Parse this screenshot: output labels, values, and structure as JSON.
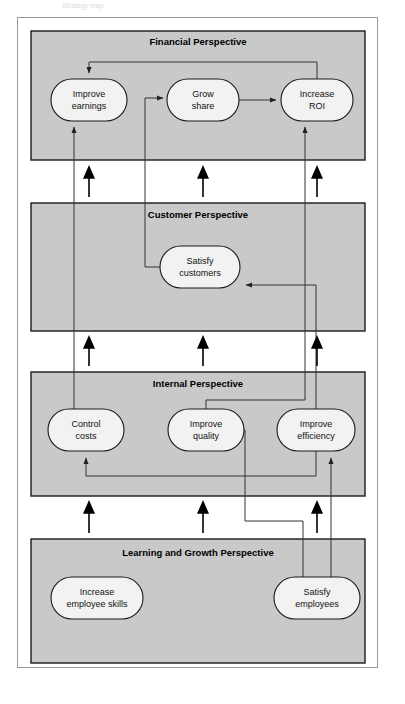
{
  "document": {
    "title_fragment": "Strategy map",
    "frame": {
      "x": 17,
      "y": 17,
      "width": 361,
      "height": 651
    }
  },
  "theme": {
    "panel_fill": "#c9c9c9",
    "panel_stroke": "#1a1a1a",
    "node_fill": "#f2f2f2",
    "node_stroke": "#1a1a1a",
    "connector_stroke": "#333333",
    "arrow_fill": "#000000",
    "page_background": "#ffffff",
    "frame_stroke": "#9a9a9a"
  },
  "panels": [
    {
      "id": "financial",
      "title": "Financial Perspective",
      "x": 31,
      "y": 31,
      "width": 334,
      "height": 129,
      "title_x": 198,
      "title_y": 45
    },
    {
      "id": "customer",
      "title": "Customer Perspective",
      "x": 31,
      "y": 203,
      "width": 334,
      "height": 128,
      "title_x": 198,
      "title_y": 218
    },
    {
      "id": "internal",
      "title": "Internal Perspective",
      "x": 31,
      "y": 372,
      "width": 334,
      "height": 124,
      "title_x": 198,
      "title_y": 387
    },
    {
      "id": "learning",
      "title": "Learning and Growth Perspective",
      "x": 31,
      "y": 539,
      "width": 334,
      "height": 124,
      "title_x": 198,
      "title_y": 556
    }
  ],
  "nodes": [
    {
      "id": "improve-earnings",
      "lines": [
        "Improve",
        "earnings"
      ],
      "cx": 89,
      "cy": 100,
      "rx": 38,
      "ry": 21,
      "panel": "financial"
    },
    {
      "id": "grow-share",
      "lines": [
        "Grow",
        "share"
      ],
      "cx": 203,
      "cy": 100,
      "rx": 36,
      "ry": 21,
      "panel": "financial"
    },
    {
      "id": "increase-roi",
      "lines": [
        "Increase",
        "ROI"
      ],
      "cx": 317,
      "cy": 100,
      "rx": 36,
      "ry": 21,
      "panel": "financial"
    },
    {
      "id": "satisfy-customers",
      "lines": [
        "Satisfy",
        "customers"
      ],
      "cx": 200,
      "cy": 267,
      "rx": 40,
      "ry": 21,
      "panel": "customer"
    },
    {
      "id": "control-costs",
      "lines": [
        "Control",
        "costs"
      ],
      "cx": 86,
      "cy": 430,
      "rx": 38,
      "ry": 21,
      "panel": "internal"
    },
    {
      "id": "improve-quality",
      "lines": [
        "Improve",
        "quality"
      ],
      "cx": 206,
      "cy": 430,
      "rx": 38,
      "ry": 21,
      "panel": "internal"
    },
    {
      "id": "improve-efficiency",
      "lines": [
        "Improve",
        "efficiency"
      ],
      "cx": 316,
      "cy": 430,
      "rx": 39,
      "ry": 21,
      "panel": "internal"
    },
    {
      "id": "increase-employee-skills",
      "lines": [
        "Increase",
        "employee skills"
      ],
      "cx": 97,
      "cy": 598,
      "rx": 46,
      "ry": 21,
      "panel": "learning"
    },
    {
      "id": "satisfy-employees",
      "lines": [
        "Satisfy",
        "employees"
      ],
      "cx": 317,
      "cy": 598,
      "rx": 43,
      "ry": 21,
      "panel": "learning"
    }
  ],
  "connections": [
    {
      "id": "grow-share-to-increase-roi",
      "from": "grow-share",
      "to": "increase-roi"
    },
    {
      "id": "increase-roi-to-improve-earnings",
      "from": "increase-roi",
      "to": "improve-earnings"
    },
    {
      "id": "control-costs-to-improve-earnings",
      "from": "control-costs",
      "to": "improve-earnings"
    },
    {
      "id": "satisfy-customers-to-grow-share",
      "from": "satisfy-customers",
      "to": "grow-share"
    },
    {
      "id": "improve-quality-to-increase-roi",
      "from": "improve-quality",
      "to": "increase-roi"
    },
    {
      "id": "improve-efficiency-to-satisfy-customers",
      "from": "improve-efficiency",
      "to": "satisfy-customers"
    },
    {
      "id": "improve-efficiency-to-control-costs",
      "from": "improve-efficiency",
      "to": "control-costs"
    },
    {
      "id": "satisfy-employees-to-improve-quality",
      "from": "satisfy-employees",
      "to": "improve-quality"
    },
    {
      "id": "satisfy-employees-to-improve-efficiency",
      "from": "satisfy-employees",
      "to": "improve-efficiency"
    }
  ],
  "layer_arrows": [
    {
      "id": "learning-to-internal-left",
      "x": 89,
      "y_from": 533,
      "y_to": 502
    },
    {
      "id": "learning-to-internal-center",
      "x": 203,
      "y_from": 533,
      "y_to": 502
    },
    {
      "id": "learning-to-internal-right",
      "x": 317,
      "y_from": 533,
      "y_to": 502
    },
    {
      "id": "internal-to-customer-left",
      "x": 89,
      "y_from": 366,
      "y_to": 337
    },
    {
      "id": "internal-to-customer-center",
      "x": 203,
      "y_from": 366,
      "y_to": 337
    },
    {
      "id": "internal-to-customer-right",
      "x": 317,
      "y_from": 366,
      "y_to": 337
    },
    {
      "id": "customer-to-financial-left",
      "x": 89,
      "y_from": 197,
      "y_to": 167
    },
    {
      "id": "customer-to-financial-center",
      "x": 203,
      "y_from": 197,
      "y_to": 167
    },
    {
      "id": "customer-to-financial-right",
      "x": 317,
      "y_from": 197,
      "y_to": 167
    }
  ]
}
